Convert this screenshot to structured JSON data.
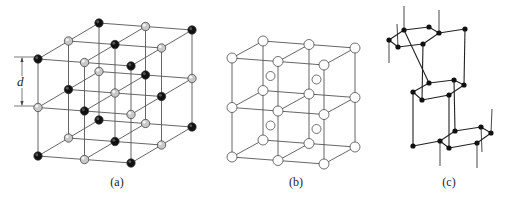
{
  "figure": {
    "panels": [
      {
        "id": "a",
        "caption": "(a)",
        "caption_pos": [
          117,
          186
        ],
        "description": "rock-salt (NaCl) cubic lattice, alternating ions"
      },
      {
        "id": "b",
        "caption": "(b)",
        "caption_pos": [
          296,
          186
        ],
        "description": "cubic lattice with body-centred sites"
      },
      {
        "id": "c",
        "caption": "(c)",
        "caption_pos": [
          449,
          186
        ],
        "description": "stacked hexagonal rings (helical chain)"
      }
    ],
    "dimension": {
      "label": "d",
      "x": 22,
      "y_top": 57,
      "y_bottom": 106,
      "ext_x1": 14,
      "ext_x2": 34,
      "label_pos": [
        17,
        86
      ]
    },
    "colors": {
      "line": "#555555",
      "atom_black": "#111111",
      "atom_gray": "#c8c8c8",
      "atom_white": "#ffffff",
      "atom_stroke": "#333333"
    },
    "lattice_a": {
      "origin": [
        38,
        59
      ],
      "ex": [
        46.5,
        3.5
      ],
      "ey": [
        0,
        48.5
      ],
      "ez": [
        30.5,
        -18
      ],
      "n": [
        3,
        3,
        3
      ],
      "radius": 4.2
    },
    "lattice_b": {
      "origin": [
        232,
        58
      ],
      "ex": [
        46,
        3.5
      ],
      "ey": [
        0,
        49.5
      ],
      "ez": [
        31,
        -17
      ],
      "n": [
        3,
        3,
        2
      ],
      "radius": 5,
      "interior": [
        [
          0.5,
          0.5,
          0.5
        ],
        [
          1.5,
          0.5,
          0.5
        ],
        [
          0.5,
          1.5,
          0.5
        ],
        [
          1.5,
          1.5,
          0.5
        ]
      ]
    },
    "chain_c": {
      "radius": 2.6,
      "nodes": [
        [
          404,
          30
        ],
        [
          429,
          27
        ],
        [
          439,
          33
        ],
        [
          423,
          44
        ],
        [
          398,
          47
        ],
        [
          389,
          40
        ],
        [
          465,
          29
        ],
        [
          429,
          83
        ],
        [
          454,
          80
        ],
        [
          464,
          85
        ],
        [
          449,
          95
        ],
        [
          422,
          100
        ],
        [
          413,
          92
        ],
        [
          455,
          131
        ],
        [
          481,
          127
        ],
        [
          491,
          133
        ],
        [
          477,
          143
        ],
        [
          449,
          148
        ],
        [
          440,
          141
        ],
        [
          413,
          146
        ]
      ],
      "edges": [
        [
          0,
          1
        ],
        [
          1,
          2
        ],
        [
          2,
          3
        ],
        [
          3,
          4
        ],
        [
          4,
          5
        ],
        [
          5,
          0
        ],
        [
          2,
          6
        ],
        [
          7,
          8
        ],
        [
          8,
          9
        ],
        [
          9,
          10
        ],
        [
          10,
          11
        ],
        [
          11,
          12
        ],
        [
          12,
          7
        ],
        [
          13,
          14
        ],
        [
          14,
          15
        ],
        [
          15,
          16
        ],
        [
          16,
          17
        ],
        [
          17,
          18
        ],
        [
          18,
          13
        ],
        [
          19,
          18
        ],
        [
          6,
          9
        ],
        [
          3,
          11
        ],
        [
          7,
          0
        ],
        [
          12,
          19
        ],
        [
          10,
          17
        ],
        [
          13,
          8
        ]
      ],
      "stubs": [
        [
          [
            404,
            30
          ],
          [
            404,
            6
          ]
        ],
        [
          [
            439,
            33
          ],
          [
            439,
            10
          ]
        ],
        [
          [
            398,
            47
          ],
          [
            397,
            24
          ]
        ],
        [
          [
            389,
            40
          ],
          [
            389,
            63
          ]
        ],
        [
          [
            440,
            141
          ],
          [
            440,
            166
          ]
        ],
        [
          [
            477,
            143
          ],
          [
            477,
            168
          ]
        ],
        [
          [
            491,
            133
          ],
          [
            492,
            109
          ]
        ],
        [
          [
            481,
            127
          ],
          [
            482,
            152
          ]
        ]
      ]
    }
  }
}
